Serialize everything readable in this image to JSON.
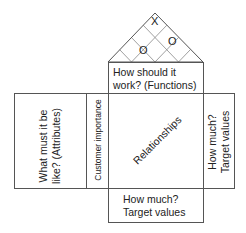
{
  "diagram": {
    "roof": {
      "label": "Correlation matrix",
      "marks": [
        {
          "symbol": "X",
          "x": 155,
          "y": 26
        },
        {
          "symbol": "O",
          "x": 173,
          "y": 45
        },
        {
          "symbol": "O",
          "x": 144,
          "y": 54
        }
      ]
    },
    "functions": {
      "line1": "How should it",
      "line2": "work? (Functions)"
    },
    "attributes": {
      "line1": "What must it be",
      "line2": "like? (Attributes)"
    },
    "customer_importance": "Customer importance",
    "relationships": "Relationships",
    "right_targets": {
      "line1": "How much?",
      "line2": "Target values"
    },
    "bottom_targets": {
      "line1": "How much?",
      "line2": "Target values"
    },
    "colors": {
      "stroke": "#555555",
      "grid": "#999999",
      "text": "#222222"
    }
  }
}
